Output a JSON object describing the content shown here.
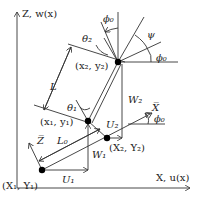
{
  "axes": {
    "z_label": "Z, w(x)",
    "x_label": "X, u(x)",
    "xbar_label": "X̅",
    "zbar_label": "Z̅"
  },
  "points": {
    "p1_ground": "(X₁, Y₁)",
    "p2_ground": "(X₂, Y₂)",
    "p1_top": "(x₁, y₁)",
    "p2_top": "(x₂, y₂)"
  },
  "lengths": {
    "L": "L",
    "L0": "L₀"
  },
  "displacements": {
    "U1": "U₁",
    "U2": "U₂",
    "W1": "W₁",
    "W2": "W₂"
  },
  "angles": {
    "theta1": "θ₁",
    "theta2": "θ₂",
    "psi": "ψ",
    "phi0_top": "ϕ₀",
    "phi0_right": "ϕ₀",
    "phi0_xbar": "ϕ₀"
  },
  "colors": {
    "line": "#333333",
    "dot": "#000000"
  }
}
